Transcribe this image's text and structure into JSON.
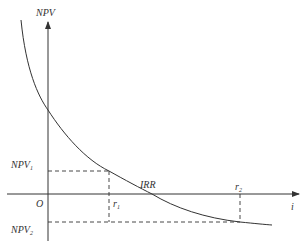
{
  "diagram": {
    "labels": {
      "y_axis": "NPV",
      "x_axis": "i",
      "origin": "O",
      "npv1_main": "NPV",
      "npv1_sub": "1",
      "npv2_main": "NPV",
      "npv2_sub": "2",
      "r1_main": "r",
      "r1_sub": "1",
      "r2_main": "r",
      "r2_sub": "2",
      "irr": "IRR"
    },
    "colors": {
      "line": "#333333",
      "background": "#ffffff"
    }
  }
}
